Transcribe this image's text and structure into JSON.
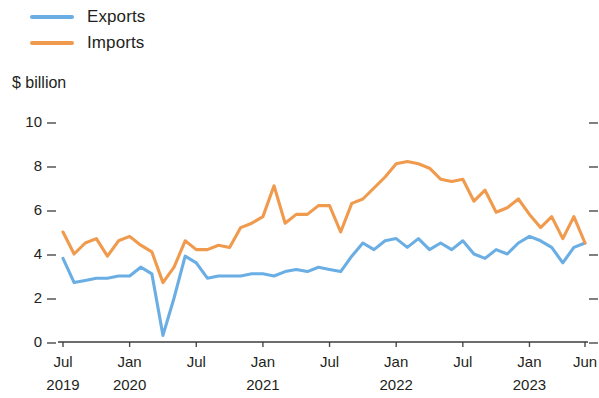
{
  "legend": {
    "position": "top-left",
    "items": [
      {
        "label": "Exports",
        "color": "#6aaee4",
        "name": "exports"
      },
      {
        "label": "Imports",
        "color": "#f09a4e",
        "name": "imports"
      }
    ]
  },
  "axis_title": "$ billion",
  "chart_data": {
    "type": "line",
    "title": "",
    "subtitle": "",
    "xlabel": "",
    "ylabel": "$ billion",
    "ylim": [
      0,
      10
    ],
    "yticks": [
      0,
      2,
      4,
      6,
      8,
      10
    ],
    "ytick_labels": [
      "0",
      "2",
      "4",
      "6",
      "8",
      "10"
    ],
    "grid": false,
    "legend_position": "top-left",
    "x_tick_labels": [
      {
        "month": "Jul",
        "year": "2019"
      },
      {
        "month": "Jan",
        "year": "2020"
      },
      {
        "month": "Jul",
        "year": ""
      },
      {
        "month": "Jan",
        "year": "2021"
      },
      {
        "month": "Jul",
        "year": ""
      },
      {
        "month": "Jan",
        "year": "2022"
      },
      {
        "month": "Jul",
        "year": ""
      },
      {
        "month": "Jan",
        "year": "2023"
      },
      {
        "month": "Jun",
        "year": ""
      }
    ],
    "x": [
      "2019-07",
      "2019-08",
      "2019-09",
      "2019-10",
      "2019-11",
      "2019-12",
      "2020-01",
      "2020-02",
      "2020-03",
      "2020-04",
      "2020-05",
      "2020-06",
      "2020-07",
      "2020-08",
      "2020-09",
      "2020-10",
      "2020-11",
      "2020-12",
      "2021-01",
      "2021-02",
      "2021-03",
      "2021-04",
      "2021-05",
      "2021-06",
      "2021-07",
      "2021-08",
      "2021-09",
      "2021-10",
      "2021-11",
      "2021-12",
      "2022-01",
      "2022-02",
      "2022-03",
      "2022-04",
      "2022-05",
      "2022-06",
      "2022-07",
      "2022-08",
      "2022-09",
      "2022-10",
      "2022-11",
      "2022-12",
      "2023-01",
      "2023-02",
      "2023-03",
      "2023-04",
      "2023-05",
      "2023-06"
    ],
    "series": [
      {
        "name": "Exports",
        "color": "#6aaee4",
        "values": [
          3.8,
          2.7,
          2.8,
          2.9,
          2.9,
          3.0,
          3.0,
          3.4,
          3.1,
          0.3,
          2.0,
          3.9,
          3.6,
          2.9,
          3.0,
          3.0,
          3.0,
          3.1,
          3.1,
          3.0,
          3.2,
          3.3,
          3.2,
          3.4,
          3.3,
          3.2,
          3.9,
          4.5,
          4.2,
          4.6,
          4.7,
          4.3,
          4.7,
          4.2,
          4.5,
          4.2,
          4.6,
          4.0,
          3.8,
          4.2,
          4.0,
          4.5,
          4.8,
          4.6,
          4.3,
          3.6,
          4.3,
          4.5
        ]
      },
      {
        "name": "Imports",
        "color": "#f09a4e",
        "values": [
          5.0,
          4.0,
          4.5,
          4.7,
          3.9,
          4.6,
          4.8,
          4.4,
          4.1,
          2.7,
          3.4,
          4.6,
          4.2,
          4.2,
          4.4,
          4.3,
          5.2,
          5.4,
          5.7,
          7.1,
          5.4,
          5.8,
          5.8,
          6.2,
          6.2,
          5.0,
          6.3,
          6.5,
          7.0,
          7.5,
          8.1,
          8.2,
          8.1,
          7.9,
          7.4,
          7.3,
          7.4,
          6.4,
          6.9,
          5.9,
          6.1,
          6.5,
          5.8,
          5.2,
          5.7,
          4.7,
          5.7,
          4.5
        ]
      }
    ],
    "notes": {
      "minimum_exports": 0.3,
      "minimum_exports_period": "2020-04",
      "maximum_imports": 8.2,
      "maximum_imports_period": "2022-02"
    }
  }
}
